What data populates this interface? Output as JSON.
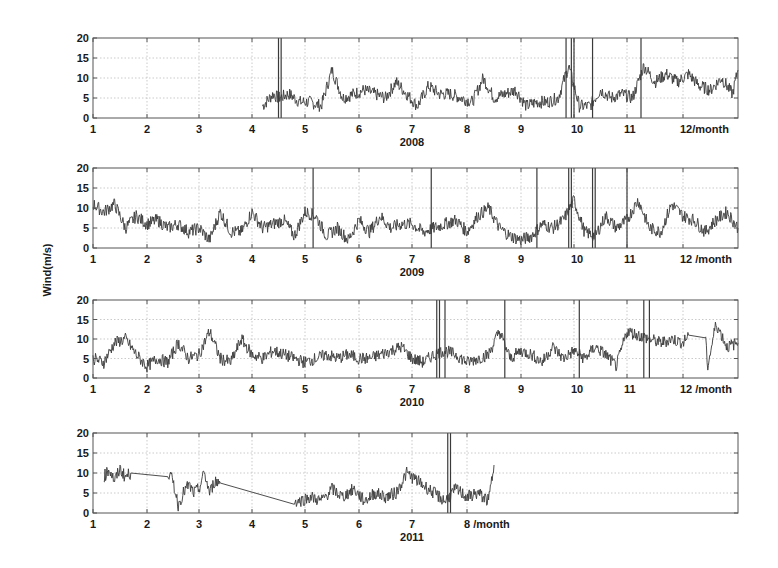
{
  "chart_data": {
    "type": "line",
    "title": "",
    "ylabel": "Wind(m/s)",
    "x_unit_label": "/month",
    "colors": {
      "line": "#3a3a3a",
      "axes": "#555555",
      "grid": "#bdbdbd",
      "text": "#1a1a1a"
    },
    "panels": [
      {
        "year": "2008",
        "xlabel": "2008",
        "xticks": [
          "1",
          "2",
          "3",
          "4",
          "5",
          "6",
          "7",
          "8",
          "9",
          "10",
          "11",
          "12/month"
        ],
        "yticks": [
          "0",
          "5",
          "10",
          "15",
          "20"
        ],
        "ylim": [
          0,
          20
        ],
        "xlim": [
          1,
          13
        ],
        "grid": true,
        "data_start_month": 4.2,
        "data_end_month": 13,
        "spikes_to_20_at_month": [
          4.5,
          4.55,
          9.85,
          9.95,
          10.0,
          10.35,
          11.25
        ],
        "series": [
          {
            "name": "wind",
            "x": [
              4.2,
              4.4,
              4.5,
              4.7,
              4.9,
              5.1,
              5.3,
              5.5,
              5.7,
              5.9,
              6.1,
              6.3,
              6.5,
              6.7,
              6.9,
              7.1,
              7.3,
              7.5,
              7.7,
              7.9,
              8.1,
              8.3,
              8.5,
              8.7,
              8.9,
              9.1,
              9.3,
              9.5,
              9.7,
              9.9,
              10.1,
              10.3,
              10.5,
              10.7,
              10.9,
              11.1,
              11.3,
              11.5,
              11.7,
              11.9,
              12.1,
              12.3,
              12.5,
              12.7,
              12.9,
              13.0
            ],
            "values": [
              3,
              6,
              5,
              6,
              4,
              4,
              3,
              12,
              5,
              6,
              7,
              6,
              5,
              9,
              6,
              3,
              8,
              6,
              6,
              5,
              4,
              10,
              5,
              6,
              7,
              3,
              4,
              4,
              5,
              13,
              3,
              3,
              7,
              5,
              6,
              5,
              13,
              9,
              11,
              9,
              11,
              8,
              7,
              10,
              6,
              12
            ]
          }
        ]
      },
      {
        "year": "2009",
        "xlabel": "2009",
        "xticks": [
          "1",
          "2",
          "3",
          "4",
          "5",
          "6",
          "7",
          "8",
          "9",
          "10",
          "11",
          "12 /month"
        ],
        "yticks": [
          "0",
          "5",
          "10",
          "15",
          "20"
        ],
        "ylim": [
          0,
          20
        ],
        "xlim": [
          1,
          13
        ],
        "grid": true,
        "data_start_month": 1,
        "data_end_month": 13,
        "spikes_to_20_at_month": [
          5.15,
          7.35,
          9.3,
          9.9,
          9.95,
          10.35,
          10.4,
          11.0
        ],
        "series": [
          {
            "name": "wind",
            "x": [
              1.0,
              1.2,
              1.4,
              1.6,
              1.8,
              2.0,
              2.2,
              2.4,
              2.6,
              2.8,
              3.0,
              3.2,
              3.4,
              3.6,
              3.8,
              4.0,
              4.2,
              4.4,
              4.6,
              4.8,
              5.0,
              5.2,
              5.4,
              5.6,
              5.8,
              6.0,
              6.2,
              6.4,
              6.6,
              6.8,
              7.0,
              7.2,
              7.4,
              7.6,
              7.8,
              8.0,
              8.2,
              8.4,
              8.6,
              8.8,
              9.0,
              9.2,
              9.4,
              9.6,
              9.8,
              10.0,
              10.2,
              10.4,
              10.6,
              10.8,
              11.0,
              11.2,
              11.4,
              11.6,
              11.8,
              12.0,
              12.2,
              12.4,
              12.6,
              12.8,
              13.0
            ],
            "values": [
              11,
              9,
              11,
              5,
              8,
              6,
              7,
              5,
              6,
              4,
              5,
              2,
              9,
              4,
              4,
              9,
              5,
              6,
              7,
              3,
              9,
              8,
              3,
              5,
              2,
              7,
              4,
              8,
              5,
              6,
              6,
              4,
              5,
              6,
              7,
              4,
              8,
              10,
              5,
              3,
              2,
              3,
              6,
              5,
              7,
              12,
              4,
              3,
              8,
              5,
              7,
              12,
              5,
              4,
              11,
              8,
              7,
              4,
              7,
              9,
              5
            ]
          }
        ]
      },
      {
        "year": "2010",
        "xlabel": "2010",
        "xticks": [
          "1",
          "2",
          "3",
          "4",
          "5",
          "6",
          "7",
          "8",
          "9",
          "10",
          "11",
          "12 /month"
        ],
        "yticks": [
          "0",
          "5",
          "10",
          "15",
          "20"
        ],
        "ylim": [
          0,
          20
        ],
        "xlim": [
          1,
          13
        ],
        "grid": true,
        "data_start_month": 1,
        "data_end_month": 13,
        "spikes_to_20_at_month": [
          7.45,
          7.5,
          7.6,
          8.7,
          10.1,
          11.3,
          11.4
        ],
        "flat_segment": {
          "from_month": 12.1,
          "to_month": 12.4,
          "value": 11
        },
        "series": [
          {
            "name": "wind",
            "x": [
              1.0,
              1.2,
              1.4,
              1.6,
              1.8,
              2.0,
              2.2,
              2.4,
              2.6,
              2.8,
              3.0,
              3.2,
              3.4,
              3.6,
              3.8,
              4.0,
              4.2,
              4.4,
              4.6,
              4.8,
              5.0,
              5.2,
              5.4,
              5.6,
              5.8,
              6.0,
              6.2,
              6.4,
              6.6,
              6.8,
              7.0,
              7.2,
              7.4,
              7.6,
              7.8,
              8.0,
              8.2,
              8.4,
              8.6,
              8.8,
              9.0,
              9.2,
              9.4,
              9.6,
              9.8,
              10.0,
              10.2,
              10.4,
              10.6,
              10.8,
              11.0,
              11.2,
              11.4,
              11.6,
              11.8,
              12.0,
              12.1,
              12.4,
              12.45,
              12.6,
              12.8,
              13.0
            ],
            "values": [
              5,
              4,
              9,
              10,
              6,
              3,
              5,
              4,
              9,
              5,
              6,
              12,
              5,
              4,
              10,
              6,
              5,
              7,
              6,
              5,
              4,
              5,
              6,
              5,
              6,
              5,
              5,
              6,
              7,
              8,
              5,
              4,
              6,
              7,
              6,
              4,
              5,
              6,
              12,
              5,
              7,
              6,
              4,
              8,
              5,
              7,
              5,
              8,
              6,
              3,
              12,
              11,
              10,
              9,
              10,
              9,
              11,
              11,
              3,
              14,
              8,
              9
            ]
          }
        ]
      },
      {
        "year": "2011",
        "xlabel": "2011",
        "xticks": [
          "1",
          "2",
          "3",
          "4",
          "5",
          "6",
          "7",
          "8 /month"
        ],
        "yticks": [
          "0",
          "5",
          "10",
          "15",
          "20"
        ],
        "ylim": [
          0,
          20
        ],
        "xlim": [
          1,
          13
        ],
        "grid": true,
        "data_start_month": 1.2,
        "data_end_month": 8.5,
        "spikes_to_20_at_month": [
          7.65,
          7.7
        ],
        "flat_segments": [
          {
            "from_month": 1.7,
            "to_month": 2.4,
            "value": 10
          },
          {
            "from_month": 3.4,
            "to_month": 4.8,
            "value": 7.5
          }
        ],
        "series": [
          {
            "name": "wind",
            "x": [
              1.2,
              1.3,
              1.4,
              1.5,
              1.6,
              1.7,
              2.4,
              2.5,
              2.6,
              2.7,
              2.8,
              2.9,
              3.0,
              3.1,
              3.2,
              3.3,
              3.4,
              4.8,
              4.9,
              5.1,
              5.3,
              5.5,
              5.7,
              5.9,
              6.1,
              6.3,
              6.5,
              6.7,
              6.9,
              7.1,
              7.3,
              7.5,
              7.6,
              7.8,
              8.0,
              8.2,
              8.4,
              8.5
            ],
            "values": [
              9,
              11,
              8,
              11,
              9,
              10,
              10,
              8,
              2,
              5,
              7,
              5,
              6,
              10,
              5,
              8,
              7.5,
              3,
              3,
              4,
              3,
              6,
              4,
              6,
              3,
              5,
              4,
              5,
              10,
              8,
              6,
              4,
              3,
              6,
              4,
              5,
              3,
              12
            ]
          }
        ]
      }
    ]
  }
}
